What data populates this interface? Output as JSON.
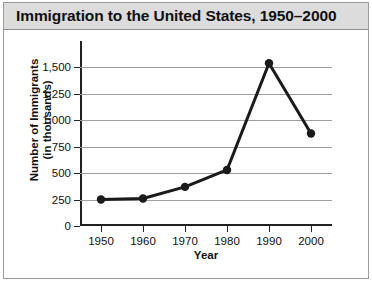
{
  "title": "Immigration to the United States, 1950–2000",
  "chart_data": {
    "type": "line",
    "title": "Immigration to the United States, 1950–2000",
    "xlabel": "Year",
    "ylabel": "Number of Immigrants\n(in thousands)",
    "ylabel_lines": [
      "Number of Immigrants",
      "(in thousands)"
    ],
    "categories": [
      "1950",
      "1960",
      "1970",
      "1980",
      "1990",
      "2000"
    ],
    "x": [
      1950,
      1960,
      1970,
      1980,
      1990,
      2000
    ],
    "values": [
      250,
      260,
      370,
      530,
      1540,
      875
    ],
    "series": [
      {
        "name": "Number of Immigrants (in thousands)",
        "values": [
          250,
          260,
          370,
          530,
          1540,
          875
        ]
      }
    ],
    "ylim": [
      0,
      1750
    ],
    "yticks": [
      0,
      250,
      500,
      750,
      1000,
      1250,
      1500
    ],
    "ytick_labels": [
      "0",
      "250",
      "500",
      "750",
      "1,000",
      "1,250",
      "1,500"
    ],
    "xticks": [
      1950,
      1960,
      1970,
      1980,
      1990,
      2000
    ],
    "xtick_labels": [
      "1950",
      "1960",
      "1970",
      "1980",
      "1990",
      "2000"
    ],
    "grid": true,
    "legend": false,
    "marker": "circle",
    "line_color": "#1a1a1a",
    "marker_color": "#1a1a1a",
    "grid_color": "#9e9e9e",
    "axis_color": "#222222",
    "title_band_color": "#dcdcdc",
    "background_color": "#ffffff"
  }
}
